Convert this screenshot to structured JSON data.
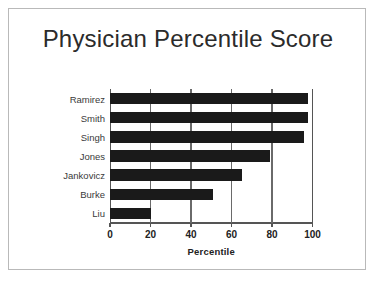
{
  "slide": {
    "background_color": "#ffffff",
    "border_color": "#b9b9b9"
  },
  "chart_data": {
    "type": "bar",
    "orientation": "horizontal",
    "title": "Physician Percentile Score",
    "xlabel": "Percentile",
    "ylabel": "",
    "categories": [
      "Ramirez",
      "Smith",
      "Singh",
      "Jones",
      "Jankovicz",
      "Burke",
      "Liu"
    ],
    "values": [
      98,
      98,
      96,
      79,
      65,
      51,
      20
    ],
    "xlim": [
      0,
      100
    ],
    "xticks": [
      0,
      20,
      40,
      60,
      80,
      100
    ],
    "xtick_labels": [
      "0",
      "20",
      "40",
      "60",
      "80",
      "100"
    ],
    "grid": "vertical",
    "legend": "none",
    "bar_color": "#1a1a1a",
    "axis_color": "#555555",
    "title_color": "#2b2b2b"
  }
}
